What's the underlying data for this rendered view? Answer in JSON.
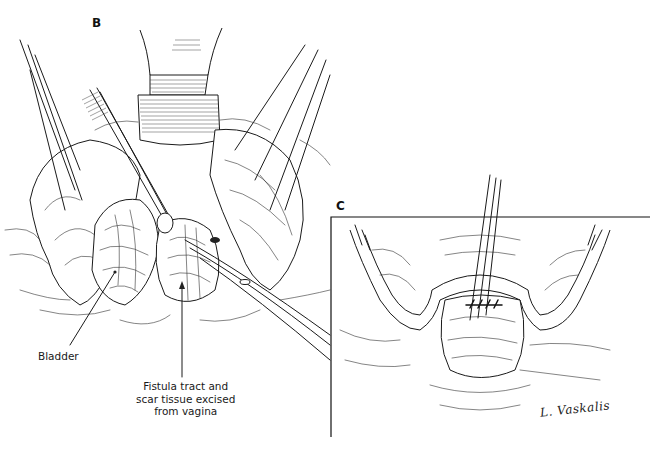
{
  "figure": {
    "type": "surgical-illustration",
    "ink_color": "#1a1a1a",
    "background": "#ffffff",
    "panels": [
      {
        "id": "B",
        "letter": "B",
        "callouts": [
          {
            "id": "bladder",
            "text": "Bladder"
          },
          {
            "id": "fistula",
            "lines": [
              "Fistula tract and",
              "scar tissue excised",
              "from vagina"
            ]
          }
        ]
      },
      {
        "id": "C",
        "letter": "C",
        "signature": "L. Vaskalis"
      }
    ]
  }
}
